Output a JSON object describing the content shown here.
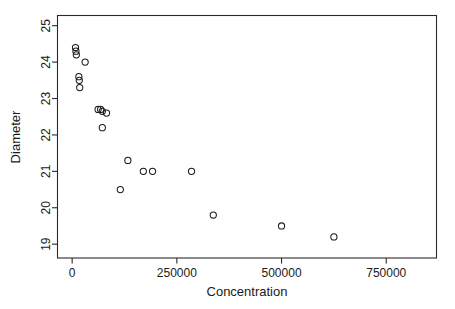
{
  "chart_data": {
    "type": "scatter",
    "title": "",
    "xlabel": "Concentration",
    "ylabel": "Diameter",
    "xlim": [
      -35000,
      870000
    ],
    "ylim": [
      18.62,
      25.28
    ],
    "xticks": [
      0,
      250000,
      500000,
      750000
    ],
    "xtick_labels": [
      "0",
      "250000",
      "500000",
      "750000"
    ],
    "yticks": [
      19,
      20,
      21,
      22,
      23,
      24,
      25
    ],
    "ytick_labels": [
      "19",
      "20",
      "21",
      "22",
      "23",
      "24",
      "25"
    ],
    "grid": false,
    "legend": null,
    "marker": "open-circle",
    "marker_color": "#1a1a1a",
    "points": [
      {
        "x": 8000,
        "y": 24.4
      },
      {
        "x": 9000,
        "y": 24.3
      },
      {
        "x": 10000,
        "y": 24.2
      },
      {
        "x": 31000,
        "y": 24.0
      },
      {
        "x": 16000,
        "y": 23.6
      },
      {
        "x": 17000,
        "y": 23.5
      },
      {
        "x": 18000,
        "y": 23.3
      },
      {
        "x": 62000,
        "y": 22.7
      },
      {
        "x": 68000,
        "y": 22.7
      },
      {
        "x": 72000,
        "y": 22.65
      },
      {
        "x": 82000,
        "y": 22.6
      },
      {
        "x": 72000,
        "y": 22.2
      },
      {
        "x": 133000,
        "y": 21.3
      },
      {
        "x": 170000,
        "y": 21.0
      },
      {
        "x": 192000,
        "y": 21.0
      },
      {
        "x": 285000,
        "y": 21.0
      },
      {
        "x": 115000,
        "y": 20.5
      },
      {
        "x": 337000,
        "y": 19.8
      },
      {
        "x": 500000,
        "y": 19.5
      },
      {
        "x": 625000,
        "y": 19.2
      }
    ]
  },
  "axes": {
    "x_title": "Concentration",
    "y_title": "Diameter"
  }
}
